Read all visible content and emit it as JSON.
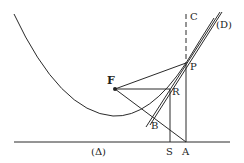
{
  "diagram": {
    "type": "geometry",
    "labels": {
      "C": "C",
      "D": "(D)",
      "P": "P",
      "F": "F",
      "R": "R",
      "B": "B",
      "S": "S",
      "A": "A",
      "delta": "(Δ)"
    }
  }
}
